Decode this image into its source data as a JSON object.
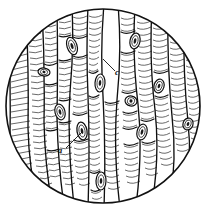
{
  "figure": {
    "kind": "botanical-micrograph-illustration",
    "field_shape": "circle",
    "background_color": "#ffffff",
    "ink_color": "#111111",
    "line_color": "#1a1a1a",
    "hatch_color": "#2b2b2b",
    "circle": {
      "cx": 103,
      "cy": 106,
      "r": 97
    }
  },
  "labels": [
    {
      "id": "label-a",
      "text": "a",
      "x": 60,
      "y": 153,
      "leader": {
        "x1": 66,
        "y1": 148,
        "x2": 82,
        "y2": 132
      }
    },
    {
      "id": "label-c",
      "text": "c",
      "x": 117,
      "y": 75,
      "leader": {
        "x1": 115,
        "y1": 71,
        "x2": 103,
        "y2": 59
      }
    }
  ],
  "cells": {
    "count": 11,
    "description": "vertical elongated tracheid cells separated by curved longitudinal walls",
    "wall_boundaries_x": [
      10,
      26,
      42,
      57,
      72,
      88,
      104,
      120,
      136,
      152,
      168,
      184,
      198
    ]
  },
  "nuclei": [
    {
      "cx": 72,
      "cy": 46,
      "rx": 5,
      "ry": 9,
      "tilt": -18
    },
    {
      "cx": 60,
      "cy": 112,
      "rx": 5,
      "ry": 8,
      "tilt": -14
    },
    {
      "cx": 44,
      "cy": 72,
      "rx": 6,
      "ry": 4,
      "tilt": 8
    },
    {
      "cx": 82,
      "cy": 131,
      "rx": 5,
      "ry": 9,
      "tilt": -10
    },
    {
      "cx": 100,
      "cy": 83,
      "rx": 5,
      "ry": 9,
      "tilt": 4
    },
    {
      "cx": 101,
      "cy": 181,
      "rx": 5,
      "ry": 9,
      "tilt": 2
    },
    {
      "cx": 135,
      "cy": 41,
      "rx": 5,
      "ry": 8,
      "tilt": 12
    },
    {
      "cx": 131,
      "cy": 101,
      "rx": 6,
      "ry": 5,
      "tilt": 10
    },
    {
      "cx": 142,
      "cy": 132,
      "rx": 5,
      "ry": 8,
      "tilt": 14
    },
    {
      "cx": 159,
      "cy": 86,
      "rx": 5,
      "ry": 7,
      "tilt": 16
    },
    {
      "cx": 188,
      "cy": 124,
      "rx": 5,
      "ry": 6,
      "tilt": 18
    }
  ]
}
